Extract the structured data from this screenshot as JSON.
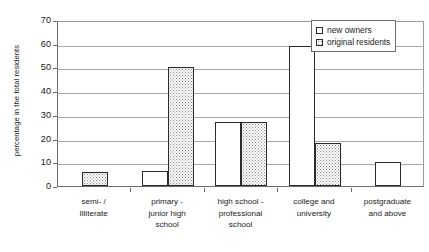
{
  "chart_data": {
    "type": "bar",
    "title": "",
    "xlabel": "",
    "ylabel": "percentage in the total residents",
    "ylim": [
      0,
      70
    ],
    "ytick_step": 10,
    "ytick_labels": [
      "0",
      "10",
      "20",
      "30",
      "40",
      "50",
      "60",
      "70"
    ],
    "grid": true,
    "legend_position": "upper right",
    "categories": [
      "semi- /\nIlliterate",
      "primary -\njunior high\nschool",
      "high school -\nprofessional\nschool",
      "college and\nuniversity",
      "postgraduate\nand above"
    ],
    "category_labels": [
      [
        "semi- /",
        "Illiterate"
      ],
      [
        "primary -",
        "junior high",
        "school"
      ],
      [
        "high school -",
        "professional",
        "school"
      ],
      [
        "college and",
        "university"
      ],
      [
        "postgraduate",
        "and above"
      ]
    ],
    "series": [
      {
        "name": "new owners",
        "fill": "white",
        "values": [
          0,
          6.5,
          27,
          59,
          10
        ]
      },
      {
        "name": "original residents",
        "fill": "dotted",
        "values": [
          6,
          50,
          27,
          18,
          0
        ]
      }
    ]
  },
  "legend": {
    "items": [
      {
        "label": "new owners",
        "swatch": "legend-swatch-white"
      },
      {
        "label": "original residents",
        "swatch": "legend-swatch-dotted"
      }
    ]
  },
  "axes": {
    "y_title": "percentage in the total residents"
  }
}
